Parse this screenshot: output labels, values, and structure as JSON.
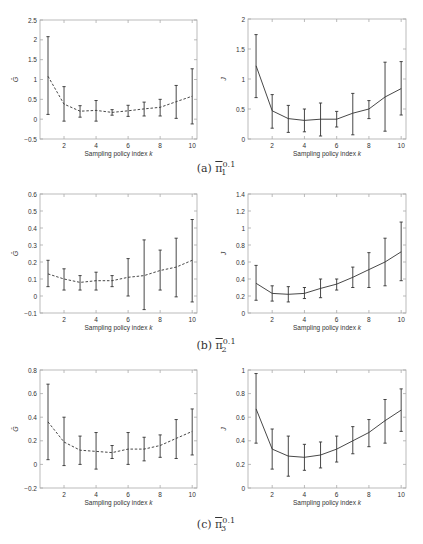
{
  "chart_data": [
    {
      "id": "a-left",
      "type": "line",
      "panel": "(a)",
      "line_style": "dashed",
      "title": "",
      "xlabel": "Sampling policy index k",
      "ylabel": "Ḡ",
      "x": [
        1,
        2,
        3,
        4,
        5,
        6,
        7,
        8,
        9,
        10
      ],
      "values": [
        1.08,
        0.38,
        0.2,
        0.22,
        0.17,
        0.21,
        0.26,
        0.3,
        0.44,
        0.58
      ],
      "err_low": [
        0.12,
        -0.05,
        0.05,
        -0.05,
        0.1,
        0.07,
        0.08,
        0.08,
        0.02,
        -0.12
      ],
      "err_high": [
        2.08,
        0.82,
        0.34,
        0.47,
        0.24,
        0.35,
        0.43,
        0.5,
        0.85,
        1.27
      ],
      "ylim": [
        -0.5,
        2.5
      ],
      "xlim": [
        0.5,
        10.3
      ],
      "yticks": [
        -0.5,
        0,
        0.5,
        1,
        1.5,
        2,
        2.5
      ],
      "ytick_labels": [
        "−0.5",
        "0",
        "0.5",
        "1",
        "1.5",
        "2",
        "2.5"
      ],
      "xticks": [
        2,
        4,
        6,
        8,
        10
      ],
      "grid": false
    },
    {
      "id": "a-right",
      "type": "line",
      "panel": "(a)",
      "line_style": "solid",
      "title": "",
      "xlabel": "Sampling policy index k",
      "ylabel": "J",
      "x": [
        1,
        2,
        3,
        4,
        5,
        6,
        7,
        8,
        9,
        10
      ],
      "values": [
        1.22,
        0.47,
        0.34,
        0.31,
        0.33,
        0.33,
        0.43,
        0.5,
        0.7,
        0.84
      ],
      "err_low": [
        0.69,
        0.18,
        0.11,
        0.12,
        0.05,
        0.2,
        0.07,
        0.34,
        0.13,
        0.4
      ],
      "err_high": [
        1.74,
        0.74,
        0.56,
        0.5,
        0.6,
        0.46,
        0.76,
        0.64,
        1.28,
        1.29
      ],
      "ylim": [
        0,
        2
      ],
      "xlim": [
        0.5,
        10.3
      ],
      "yticks": [
        0,
        0.5,
        1,
        1.5,
        2
      ],
      "ytick_labels": [
        "0",
        "0.5",
        "1",
        "1.5",
        "2"
      ],
      "xticks": [
        2,
        4,
        6,
        8,
        10
      ],
      "grid": false
    },
    {
      "id": "b-left",
      "type": "line",
      "panel": "(b)",
      "line_style": "dashed",
      "title": "",
      "xlabel": "Sampling policy index k",
      "ylabel": "Ḡ",
      "x": [
        1,
        2,
        3,
        4,
        5,
        6,
        7,
        8,
        9,
        10
      ],
      "values": [
        0.13,
        0.1,
        0.08,
        0.09,
        0.09,
        0.11,
        0.12,
        0.15,
        0.17,
        0.21
      ],
      "err_low": [
        0.055,
        0.035,
        0.035,
        0.035,
        0.055,
        0.0,
        -0.08,
        0.035,
        -0.005,
        -0.035
      ],
      "err_high": [
        0.21,
        0.16,
        0.12,
        0.14,
        0.12,
        0.22,
        0.33,
        0.27,
        0.34,
        0.45
      ],
      "ylim": [
        -0.1,
        0.6
      ],
      "xlim": [
        0.5,
        10.3
      ],
      "yticks": [
        -0.1,
        0,
        0.1,
        0.2,
        0.3,
        0.4,
        0.5,
        0.6
      ],
      "ytick_labels": [
        "−0.1",
        "0",
        "0.1",
        "0.2",
        "0.3",
        "0.4",
        "0.5",
        "0.6"
      ],
      "xticks": [
        2,
        4,
        6,
        8,
        10
      ],
      "grid": false
    },
    {
      "id": "b-right",
      "type": "line",
      "panel": "(b)",
      "line_style": "solid",
      "title": "",
      "xlabel": "Sampling policy index k",
      "ylabel": "J",
      "x": [
        1,
        2,
        3,
        4,
        5,
        6,
        7,
        8,
        9,
        10
      ],
      "values": [
        0.35,
        0.23,
        0.22,
        0.23,
        0.29,
        0.34,
        0.42,
        0.51,
        0.6,
        0.72
      ],
      "err_low": [
        0.15,
        0.14,
        0.13,
        0.17,
        0.18,
        0.27,
        0.3,
        0.3,
        0.32,
        0.38
      ],
      "err_high": [
        0.56,
        0.32,
        0.31,
        0.3,
        0.4,
        0.4,
        0.54,
        0.71,
        0.88,
        1.07
      ],
      "ylim": [
        0,
        1.4
      ],
      "xlim": [
        0.5,
        10.3
      ],
      "yticks": [
        0,
        0.2,
        0.4,
        0.6,
        0.8,
        1,
        1.2,
        1.4
      ],
      "ytick_labels": [
        "0",
        "0.2",
        "0.4",
        "0.6",
        "0.8",
        "1",
        "1.2",
        "1.4"
      ],
      "xticks": [
        2,
        4,
        6,
        8,
        10
      ],
      "grid": false
    },
    {
      "id": "c-left",
      "type": "line",
      "panel": "(c)",
      "line_style": "dashed",
      "title": "",
      "xlabel": "Sampling policy index k",
      "ylabel": "Ḡ",
      "x": [
        1,
        2,
        3,
        4,
        5,
        6,
        7,
        8,
        9,
        10
      ],
      "values": [
        0.36,
        0.19,
        0.12,
        0.11,
        0.1,
        0.13,
        0.13,
        0.16,
        0.22,
        0.28
      ],
      "err_low": [
        0.04,
        -0.01,
        0.0,
        -0.04,
        0.05,
        0.0,
        0.03,
        0.06,
        0.05,
        0.08
      ],
      "err_high": [
        0.68,
        0.4,
        0.24,
        0.27,
        0.16,
        0.27,
        0.23,
        0.25,
        0.38,
        0.47
      ],
      "ylim": [
        -0.2,
        0.8
      ],
      "xlim": [
        0.5,
        10.3
      ],
      "yticks": [
        -0.2,
        0,
        0.2,
        0.4,
        0.6,
        0.8
      ],
      "ytick_labels": [
        "−0.2",
        "0",
        "0.2",
        "0.4",
        "0.6",
        "0.8"
      ],
      "xticks": [
        2,
        4,
        6,
        8,
        10
      ],
      "grid": false
    },
    {
      "id": "c-right",
      "type": "line",
      "panel": "(c)",
      "line_style": "solid",
      "title": "",
      "xlabel": "Sampling policy index k",
      "ylabel": "J",
      "x": [
        1,
        2,
        3,
        4,
        5,
        6,
        7,
        8,
        9,
        10
      ],
      "values": [
        0.67,
        0.33,
        0.27,
        0.26,
        0.28,
        0.33,
        0.4,
        0.47,
        0.57,
        0.66
      ],
      "err_low": [
        0.38,
        0.16,
        0.1,
        0.15,
        0.17,
        0.22,
        0.29,
        0.35,
        0.38,
        0.48
      ],
      "err_high": [
        0.97,
        0.5,
        0.44,
        0.37,
        0.39,
        0.44,
        0.52,
        0.58,
        0.75,
        0.84
      ],
      "ylim": [
        0,
        1
      ],
      "xlim": [
        0.5,
        10.3
      ],
      "yticks": [
        0,
        0.2,
        0.4,
        0.6,
        0.8,
        1
      ],
      "ytick_labels": [
        "0",
        "0.2",
        "0.4",
        "0.6",
        "0.8",
        "1"
      ],
      "xticks": [
        2,
        4,
        6,
        8,
        10
      ],
      "grid": false
    }
  ],
  "captions": {
    "a": {
      "label": "(a)",
      "symbol": "π",
      "sub": "1",
      "sup": "0.1"
    },
    "b": {
      "label": "(b)",
      "symbol": "π",
      "sub": "2",
      "sup": "0.1"
    },
    "c": {
      "label": "(c)",
      "symbol": "π",
      "sub": "3",
      "sup": "0.1"
    }
  },
  "colors": {
    "axis": "#aaaaaa",
    "line": "#333333",
    "text": "#333333"
  }
}
